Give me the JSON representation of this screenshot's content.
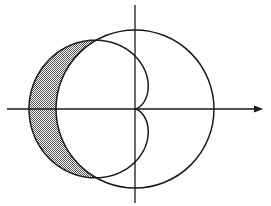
{
  "diagram": {
    "type": "polar-curves",
    "origin": [
      135,
      109
    ],
    "cardioid": {
      "a": 53
    },
    "circle": {
      "r": 79
    },
    "axes": {
      "x": {
        "from": 7,
        "to": 263,
        "arrow": true
      },
      "y": {
        "from": 5,
        "to": 203,
        "arrow": false
      }
    },
    "colors": {
      "stroke": "#1a1a1a",
      "shade": "#a8a8a8",
      "background": "#ffffff"
    }
  }
}
